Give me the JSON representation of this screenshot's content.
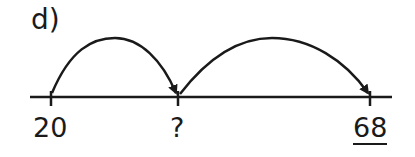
{
  "problem_label": "d)",
  "number_line": {
    "ticks": [
      {
        "label": "20",
        "underlined": false
      },
      {
        "label": "?",
        "underlined": false
      },
      {
        "label": "68",
        "underlined": true
      }
    ],
    "jumps": [
      {
        "from": "20",
        "to": "?"
      },
      {
        "from": "?",
        "to": "68"
      }
    ]
  }
}
